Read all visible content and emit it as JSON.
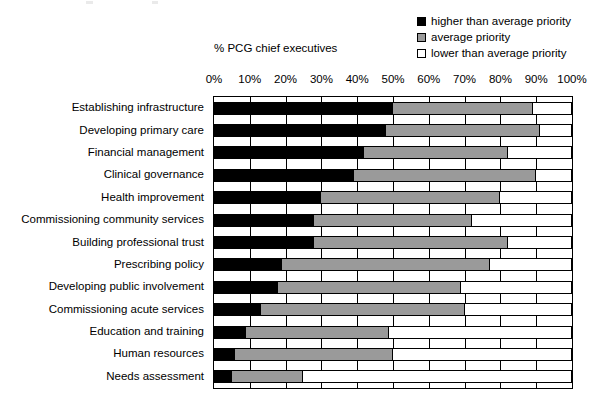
{
  "axis_title": "% PCG chief executives",
  "legend": {
    "items": [
      {
        "label": "higher than average priority",
        "icon": "filled-square-icon",
        "color": "#000000"
      },
      {
        "label": "average priority",
        "icon": "gray-square-icon",
        "color": "#9a9a9a"
      },
      {
        "label": "lower than average priority",
        "icon": "empty-square-icon",
        "color": "#ffffff"
      }
    ]
  },
  "chart_data": {
    "type": "bar",
    "orientation": "horizontal",
    "stacked": true,
    "normalized_percent": true,
    "title": "",
    "subtitle": "",
    "xlabel": "% PCG chief executives",
    "ylabel": "",
    "xlim": [
      0,
      100
    ],
    "grid": true,
    "legend_position": "top-right",
    "xticks": [
      0,
      10,
      20,
      30,
      40,
      50,
      60,
      70,
      80,
      90,
      100
    ],
    "xticklabels": [
      "0%",
      "10%",
      "20%",
      "30%",
      "40%",
      "50%",
      "60%",
      "70%",
      "80%",
      "90%",
      "100%"
    ],
    "categories": [
      "Establishing infrastructure",
      "Developing primary care",
      "Financial management",
      "Clinical governance",
      "Health improvement",
      "Commissioning community services",
      "Building professional trust",
      "Prescribing policy",
      "Developing public involvement",
      "Commissioning acute services",
      "Education and training",
      "Human resources",
      "Needs assessment"
    ],
    "series": [
      {
        "name": "higher than average priority",
        "color": "#000000",
        "values": [
          50,
          48,
          42,
          39,
          30,
          28,
          28,
          19,
          18,
          13,
          9,
          6,
          5
        ]
      },
      {
        "name": "average priority",
        "color": "#9a9a9a",
        "values": [
          39,
          43,
          40,
          51,
          50,
          44,
          54,
          58,
          51,
          57,
          40,
          44,
          20
        ]
      },
      {
        "name": "lower than average priority",
        "color": "#ffffff",
        "values": [
          11,
          9,
          18,
          10,
          20,
          28,
          18,
          23,
          31,
          30,
          51,
          50,
          75
        ]
      }
    ],
    "cumulative_boundaries": [
      [
        50,
        89
      ],
      [
        48,
        91
      ],
      [
        42,
        82
      ],
      [
        39,
        90
      ],
      [
        30,
        80
      ],
      [
        28,
        72
      ],
      [
        28,
        82
      ],
      [
        19,
        77
      ],
      [
        18,
        69
      ],
      [
        13,
        70
      ],
      [
        9,
        49
      ],
      [
        6,
        50
      ],
      [
        5,
        25
      ]
    ]
  }
}
